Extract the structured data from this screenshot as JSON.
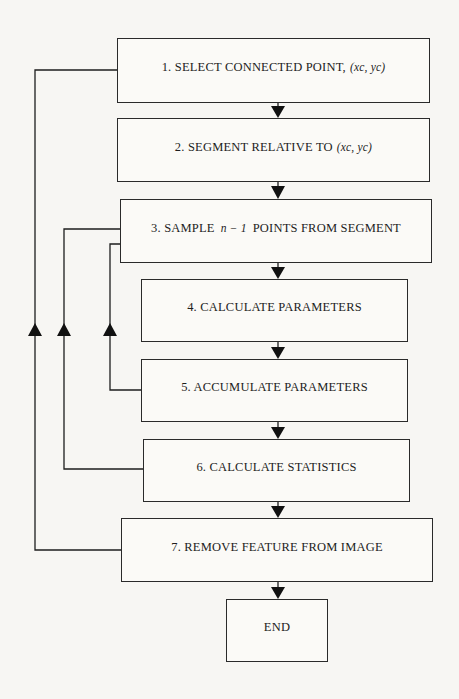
{
  "diagram": {
    "type": "flowchart",
    "steps": [
      {
        "id": 1,
        "text": "1. SELECT CONNECTED POINT,",
        "math": "(xc, yc)"
      },
      {
        "id": 2,
        "text": "2. SEGMENT RELATIVE TO",
        "math": "(xc, yc)"
      },
      {
        "id": 3,
        "text": "3. SAMPLE",
        "math": "n − 1",
        "text_after": "POINTS FROM SEGMENT"
      },
      {
        "id": 4,
        "text": "4. CALCULATE PARAMETERS"
      },
      {
        "id": 5,
        "text": "5. ACCUMULATE PARAMETERS"
      },
      {
        "id": 6,
        "text": "6. CALCULATE STATISTICS"
      },
      {
        "id": 7,
        "text": "7. REMOVE FEATURE FROM IMAGE"
      },
      {
        "id": 8,
        "text": "END"
      }
    ],
    "flow": [
      {
        "from": 1,
        "to": 2,
        "kind": "sequential"
      },
      {
        "from": 2,
        "to": 3,
        "kind": "sequential"
      },
      {
        "from": 3,
        "to": 4,
        "kind": "sequential"
      },
      {
        "from": 4,
        "to": 5,
        "kind": "sequential"
      },
      {
        "from": 5,
        "to": 6,
        "kind": "sequential"
      },
      {
        "from": 6,
        "to": 7,
        "kind": "sequential"
      },
      {
        "from": 7,
        "to": 8,
        "kind": "sequential"
      },
      {
        "from": 5,
        "to": 3,
        "kind": "loop-back"
      },
      {
        "from": 6,
        "to": 3,
        "kind": "loop-back"
      },
      {
        "from": 7,
        "to": 1,
        "kind": "loop-back"
      }
    ],
    "colors": {
      "line": "#1e1e1e",
      "box_border": "#2a2a2a",
      "background": "#f7f6f3"
    }
  }
}
